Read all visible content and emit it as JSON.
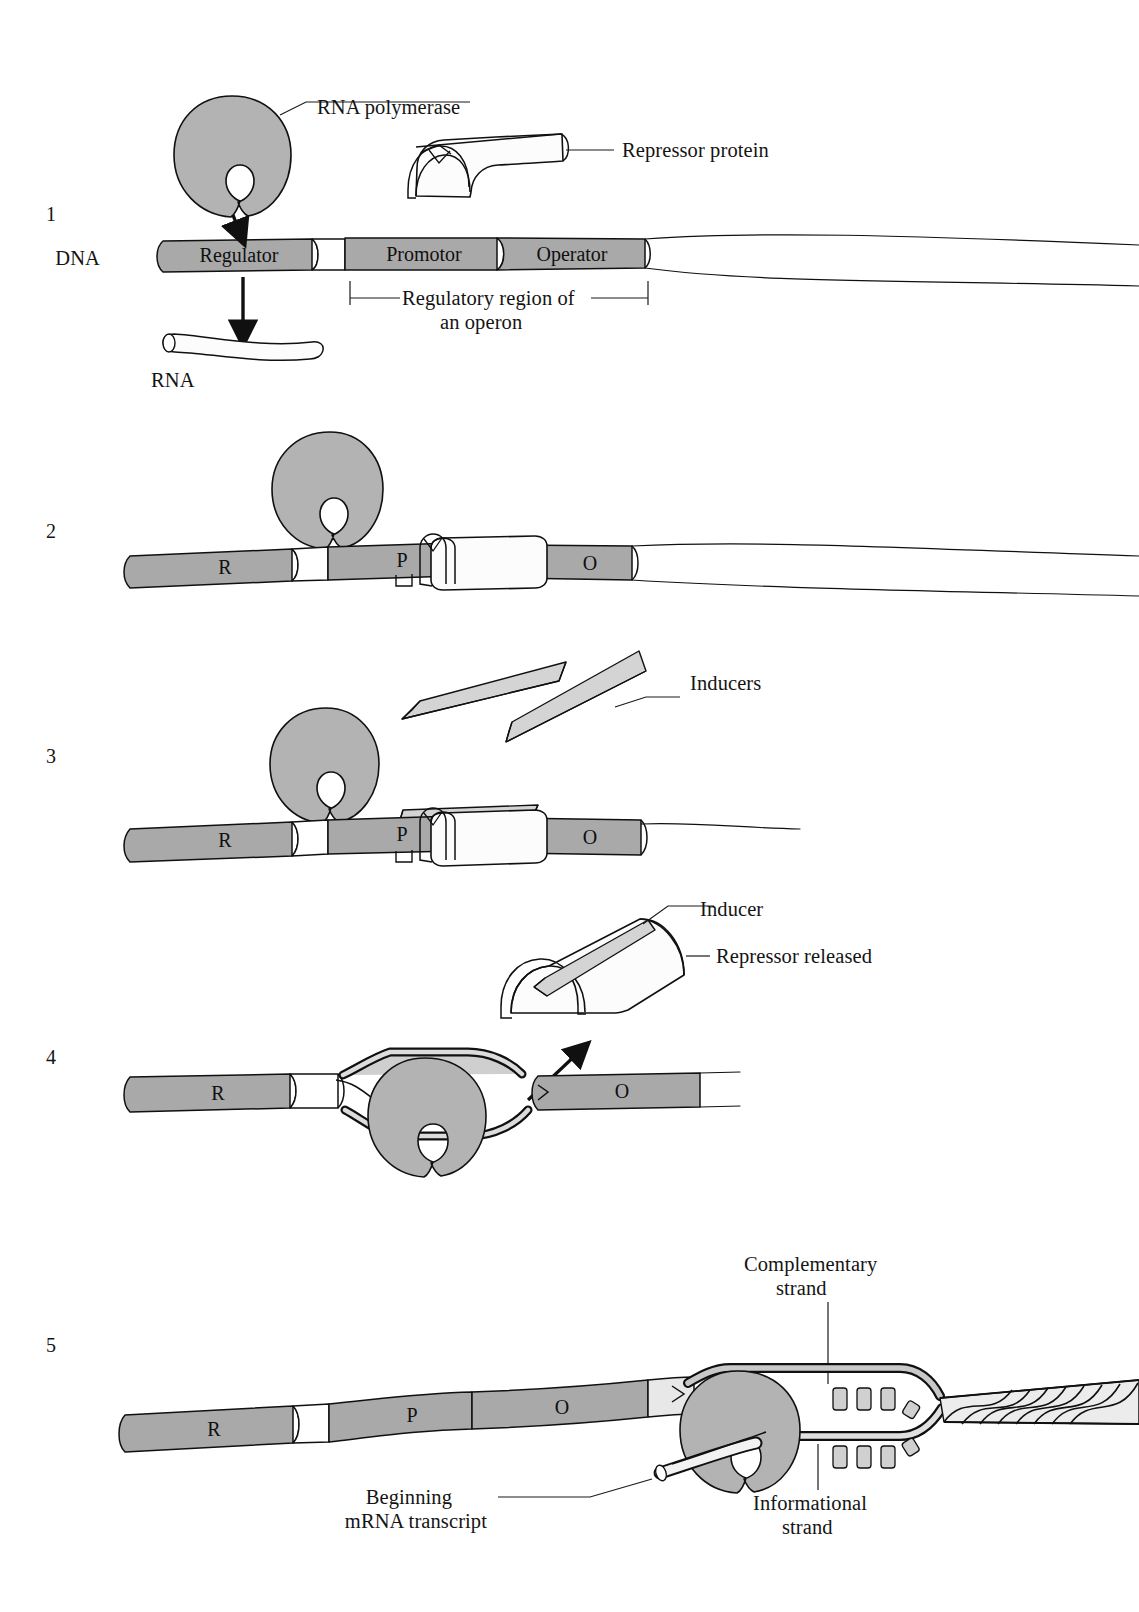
{
  "figure": {
    "panel_numbers": [
      "1",
      "2",
      "3",
      "4",
      "5"
    ]
  },
  "colors": {
    "dna_segment_gray": "#a9a9a9",
    "dna_spacer_white": "#ffffff",
    "polymerase_gray": "#b3b3b3",
    "repressor_white": "#fcfcfc",
    "inducer_gray": "#d4d4d4",
    "strand_light": "#e8e8e8",
    "outline": "#101010",
    "text": "#141414",
    "background": "#ffffff"
  },
  "panels": [
    {
      "number": "1",
      "labels": {
        "polymerase": "RNA polymerase",
        "repressor": "Repressor protein",
        "dna": "DNA",
        "rna": "RNA",
        "bracket_line1": "Regulatory region of",
        "bracket_line2": "an operon"
      },
      "dna_segments": [
        {
          "id": "regulator",
          "label": "Regulator"
        },
        {
          "id": "spacer",
          "label": ""
        },
        {
          "id": "promotor",
          "label": "Promotor"
        },
        {
          "id": "operator",
          "label": "Operator"
        }
      ]
    },
    {
      "number": "2",
      "labels": {},
      "dna_segments": [
        {
          "id": "regulator",
          "label": "R"
        },
        {
          "id": "spacer",
          "label": ""
        },
        {
          "id": "promotor",
          "label": "P"
        },
        {
          "id": "operator",
          "label": "O"
        }
      ]
    },
    {
      "number": "3",
      "labels": {
        "inducers": "Inducers"
      },
      "dna_segments": [
        {
          "id": "regulator",
          "label": "R"
        },
        {
          "id": "spacer",
          "label": ""
        },
        {
          "id": "promotor",
          "label": "P"
        },
        {
          "id": "operator",
          "label": "O"
        }
      ]
    },
    {
      "number": "4",
      "labels": {
        "inducer": "Inducer",
        "repressor_released": "Repressor released"
      },
      "dna_segments": [
        {
          "id": "regulator",
          "label": "R"
        },
        {
          "id": "operator",
          "label": "O"
        }
      ]
    },
    {
      "number": "5",
      "labels": {
        "complementary_line1": "Complementary",
        "complementary_line2": "strand",
        "informational_line1": "Informational",
        "informational_line2": "strand",
        "beginning_line1": "Beginning",
        "beginning_line2": "mRNA transcript"
      },
      "dna_segments": [
        {
          "id": "regulator",
          "label": "R"
        },
        {
          "id": "spacer",
          "label": ""
        },
        {
          "id": "promotor",
          "label": "P"
        },
        {
          "id": "operator",
          "label": "O"
        }
      ]
    }
  ]
}
